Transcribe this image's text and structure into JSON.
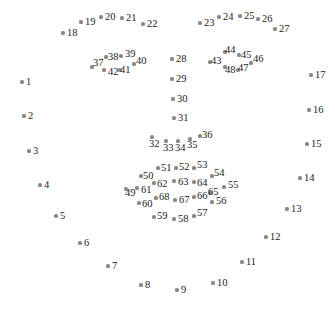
{
  "diagram": {
    "title": "",
    "dot_color": "#8a8a8a",
    "label_color": "#222222",
    "points": [
      {
        "id": "1",
        "x": 22,
        "y": 82,
        "lx": 4,
        "ly": -5
      },
      {
        "id": "2",
        "x": 24,
        "y": 116,
        "lx": 4,
        "ly": -5
      },
      {
        "id": "3",
        "x": 29,
        "y": 151,
        "lx": 4,
        "ly": -5
      },
      {
        "id": "4",
        "x": 40,
        "y": 185,
        "lx": 4,
        "ly": -5
      },
      {
        "id": "5",
        "x": 56,
        "y": 216,
        "lx": 4,
        "ly": -5
      },
      {
        "id": "6",
        "x": 80,
        "y": 243,
        "lx": 4,
        "ly": -5
      },
      {
        "id": "7",
        "x": 108,
        "y": 266,
        "lx": 4,
        "ly": -5
      },
      {
        "id": "8",
        "x": 141,
        "y": 285,
        "lx": 4,
        "ly": -5
      },
      {
        "id": "9",
        "x": 177,
        "y": 290,
        "lx": 4,
        "ly": -5
      },
      {
        "id": "10",
        "x": 213,
        "y": 283,
        "lx": 4,
        "ly": -5
      },
      {
        "id": "11",
        "x": 242,
        "y": 262,
        "lx": 4,
        "ly": -5
      },
      {
        "id": "12",
        "x": 266,
        "y": 237,
        "lx": 4,
        "ly": -5
      },
      {
        "id": "13",
        "x": 287,
        "y": 209,
        "lx": 4,
        "ly": -5
      },
      {
        "id": "14",
        "x": 300,
        "y": 178,
        "lx": 4,
        "ly": -5
      },
      {
        "id": "15",
        "x": 307,
        "y": 144,
        "lx": 4,
        "ly": -5
      },
      {
        "id": "16",
        "x": 309,
        "y": 110,
        "lx": 4,
        "ly": -5
      },
      {
        "id": "17",
        "x": 311,
        "y": 75,
        "lx": 4,
        "ly": -5
      },
      {
        "id": "18",
        "x": 63,
        "y": 33,
        "lx": 4,
        "ly": -5
      },
      {
        "id": "19",
        "x": 81,
        "y": 22,
        "lx": 4,
        "ly": -5
      },
      {
        "id": "20",
        "x": 101,
        "y": 17,
        "lx": 4,
        "ly": -5
      },
      {
        "id": "21",
        "x": 122,
        "y": 18,
        "lx": 4,
        "ly": -5
      },
      {
        "id": "22",
        "x": 143,
        "y": 24,
        "lx": 4,
        "ly": -5
      },
      {
        "id": "23",
        "x": 200,
        "y": 23,
        "lx": 4,
        "ly": -5
      },
      {
        "id": "24",
        "x": 219,
        "y": 17,
        "lx": 4,
        "ly": -5
      },
      {
        "id": "25",
        "x": 240,
        "y": 16,
        "lx": 4,
        "ly": -5
      },
      {
        "id": "26",
        "x": 258,
        "y": 19,
        "lx": 4,
        "ly": -5
      },
      {
        "id": "27",
        "x": 275,
        "y": 29,
        "lx": 4,
        "ly": -5
      },
      {
        "id": "28",
        "x": 172,
        "y": 59,
        "lx": 4,
        "ly": -5
      },
      {
        "id": "29",
        "x": 172,
        "y": 79,
        "lx": 4,
        "ly": -5
      },
      {
        "id": "30",
        "x": 173,
        "y": 99,
        "lx": 4,
        "ly": -5
      },
      {
        "id": "31",
        "x": 174,
        "y": 118,
        "lx": 4,
        "ly": -5
      },
      {
        "id": "32",
        "x": 152,
        "y": 137,
        "lx": -3,
        "ly": 2
      },
      {
        "id": "33",
        "x": 166,
        "y": 141,
        "lx": -3,
        "ly": 2
      },
      {
        "id": "34",
        "x": 178,
        "y": 141,
        "lx": -3,
        "ly": 2
      },
      {
        "id": "35",
        "x": 190,
        "y": 139,
        "lx": -3,
        "ly": 1
      },
      {
        "id": "36",
        "x": 200,
        "y": 136,
        "lx": 2,
        "ly": -6
      },
      {
        "id": "37",
        "x": 92,
        "y": 67,
        "lx": 1,
        "ly": -9
      },
      {
        "id": "38",
        "x": 106,
        "y": 57,
        "lx": 2,
        "ly": -5
      },
      {
        "id": "39",
        "x": 121,
        "y": 56,
        "lx": 4,
        "ly": -7
      },
      {
        "id": "40",
        "x": 134,
        "y": 64,
        "lx": 2,
        "ly": -8
      },
      {
        "id": "41",
        "x": 120,
        "y": 70,
        "lx": 0,
        "ly": -5
      },
      {
        "id": "42",
        "x": 104,
        "y": 70,
        "lx": 4,
        "ly": -3
      },
      {
        "id": "43",
        "x": 210,
        "y": 62,
        "lx": 1,
        "ly": -6
      },
      {
        "id": "44",
        "x": 225,
        "y": 52,
        "lx": 0,
        "ly": -7
      },
      {
        "id": "45",
        "x": 239,
        "y": 55,
        "lx": 2,
        "ly": -5
      },
      {
        "id": "46",
        "x": 251,
        "y": 63,
        "lx": 2,
        "ly": -9
      },
      {
        "id": "47",
        "x": 238,
        "y": 70,
        "lx": 0,
        "ly": -7
      },
      {
        "id": "48",
        "x": 225,
        "y": 67,
        "lx": 0,
        "ly": -2
      },
      {
        "id": "49",
        "x": 126,
        "y": 189,
        "lx": -1,
        "ly": -1
      },
      {
        "id": "50",
        "x": 141,
        "y": 176,
        "lx": 2,
        "ly": -5
      },
      {
        "id": "51",
        "x": 158,
        "y": 168,
        "lx": 3,
        "ly": -5
      },
      {
        "id": "52",
        "x": 176,
        "y": 168,
        "lx": 3,
        "ly": -6
      },
      {
        "id": "53",
        "x": 194,
        "y": 168,
        "lx": 3,
        "ly": -8
      },
      {
        "id": "54",
        "x": 212,
        "y": 176,
        "lx": 2,
        "ly": -8
      },
      {
        "id": "55",
        "x": 224,
        "y": 187,
        "lx": 4,
        "ly": -7
      },
      {
        "id": "56",
        "x": 212,
        "y": 202,
        "lx": 4,
        "ly": -6
      },
      {
        "id": "57",
        "x": 194,
        "y": 216,
        "lx": 3,
        "ly": -8
      },
      {
        "id": "58",
        "x": 174,
        "y": 219,
        "lx": 4,
        "ly": -5
      },
      {
        "id": "59",
        "x": 154,
        "y": 217,
        "lx": 3,
        "ly": -6
      },
      {
        "id": "60",
        "x": 139,
        "y": 203,
        "lx": 3,
        "ly": -4
      },
      {
        "id": "61",
        "x": 137,
        "y": 188,
        "lx": 4,
        "ly": -3
      },
      {
        "id": "62",
        "x": 154,
        "y": 183,
        "lx": 3,
        "ly": -4
      },
      {
        "id": "63",
        "x": 174,
        "y": 181,
        "lx": 4,
        "ly": -4
      },
      {
        "id": "64",
        "x": 194,
        "y": 182,
        "lx": 3,
        "ly": -4
      },
      {
        "id": "65",
        "x": 210,
        "y": 193,
        "lx": -2,
        "ly": -6
      },
      {
        "id": "66",
        "x": 194,
        "y": 197,
        "lx": 3,
        "ly": -6
      },
      {
        "id": "67",
        "x": 175,
        "y": 200,
        "lx": 4,
        "ly": -5
      },
      {
        "id": "68",
        "x": 156,
        "y": 198,
        "lx": 3,
        "ly": -6
      }
    ]
  }
}
